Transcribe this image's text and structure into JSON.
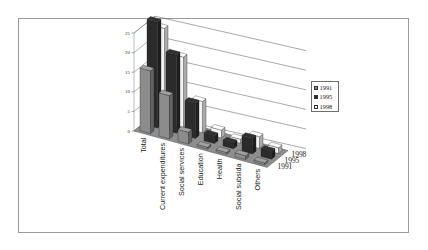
{
  "chart_data": {
    "type": "bar",
    "subtype": "3d-clustered-column",
    "title": "",
    "xlabel": "",
    "ylabel": "",
    "ylim": [
      0,
      25
    ],
    "yticks": [
      "0",
      "5",
      "10",
      "15",
      "20",
      "25"
    ],
    "grid": true,
    "legend_position": "right",
    "categories": [
      "Total",
      "Current expenditures",
      "Social services",
      "Education",
      "Health",
      "Social subsidies",
      "Others"
    ],
    "category_labels": [
      "Total",
      "Current expenditures",
      "Social services",
      "Education",
      "Health",
      "Social subsida",
      "Others"
    ],
    "depth_labels": [
      "1998",
      "1995",
      "1991"
    ],
    "series": [
      {
        "name": "1991",
        "color": "#8c8c8c",
        "values": [
          16,
          11,
          3,
          0.5,
          0.5,
          1,
          0.5
        ]
      },
      {
        "name": "1995",
        "color": "#2b2b2b",
        "values": [
          27,
          20,
          9,
          2,
          1.5,
          4,
          2
        ]
      },
      {
        "name": "1998",
        "color": "#f4f4f4",
        "values": [
          24,
          18,
          8,
          2,
          1,
          3,
          1.5
        ]
      }
    ]
  },
  "legend": {
    "items": [
      {
        "label": "1991",
        "color": "#8c8c8c"
      },
      {
        "label": "1995",
        "color": "#2b2b2b"
      },
      {
        "label": "1998",
        "color": "#f4f4f4"
      }
    ]
  }
}
